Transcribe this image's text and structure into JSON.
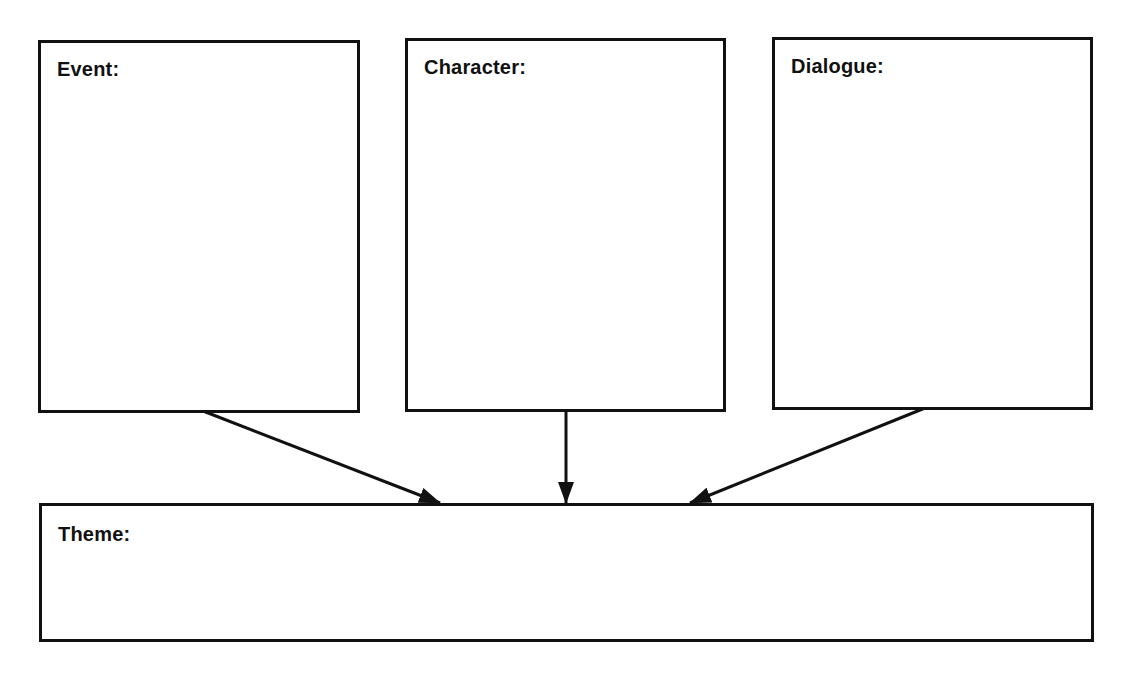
{
  "diagram": {
    "type": "graphic-organizer",
    "boxes": [
      {
        "id": "event",
        "label": "Event:"
      },
      {
        "id": "character",
        "label": "Character:"
      },
      {
        "id": "dialogue",
        "label": "Dialogue:"
      },
      {
        "id": "theme",
        "label": "Theme:"
      }
    ],
    "arrows": [
      {
        "from": "event",
        "to": "theme"
      },
      {
        "from": "character",
        "to": "theme"
      },
      {
        "from": "dialogue",
        "to": "theme"
      }
    ],
    "colors": {
      "stroke": "#111111",
      "background": "#ffffff"
    }
  }
}
